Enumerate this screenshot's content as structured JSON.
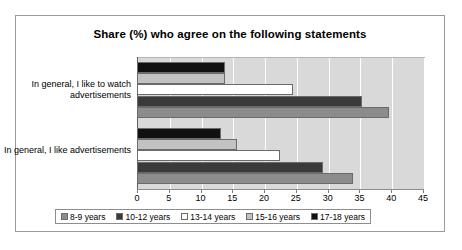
{
  "chart_data": {
    "type": "bar",
    "orientation": "horizontal",
    "title": "Share (%) who agree on the following statements",
    "xlabel": "",
    "ylabel": "",
    "xlim": [
      0,
      45
    ],
    "xticks": [
      0,
      5,
      10,
      15,
      20,
      25,
      30,
      35,
      40,
      45
    ],
    "grid": "vertical",
    "legend_position": "bottom",
    "categories": [
      "In general, I like to watch advertisements",
      "In general, I like advertisements"
    ],
    "series": [
      {
        "name": "8-9 years",
        "color": "#8c8c8c",
        "values": [
          39.6,
          34.0
        ]
      },
      {
        "name": "10-12 years",
        "color": "#3a3a3a",
        "values": [
          35.4,
          29.3
        ]
      },
      {
        "name": "13-14 years",
        "color": "#ffffff",
        "values": [
          24.6,
          22.5
        ]
      },
      {
        "name": "15-16 years",
        "color": "#c2c2c2",
        "values": [
          13.8,
          15.7
        ]
      },
      {
        "name": "17-18 years",
        "color": "#111111",
        "values": [
          13.8,
          13.2
        ]
      }
    ]
  },
  "colors": {
    "plot_background": "#d9d9d9",
    "frame_border": "#9a9a9a",
    "gridline": "#ffffff",
    "bar_outline": "#6b6b6b"
  }
}
